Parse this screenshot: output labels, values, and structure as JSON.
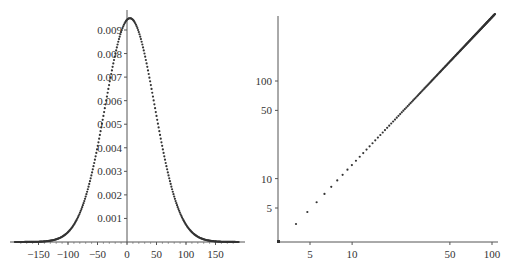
{
  "colors": {
    "axis": "#555555",
    "curve": "#333333",
    "background": "#ffffff"
  },
  "chart_data": [
    {
      "type": "scatter",
      "title": "",
      "xlabel": "",
      "ylabel": "",
      "description": "Gaussian-shaped density curve plotted as dense points",
      "xlim": [
        -190,
        190
      ],
      "ylim": [
        0,
        0.0096
      ],
      "grid": false,
      "x_ticks": [
        -150,
        -100,
        -50,
        0,
        50,
        100,
        150
      ],
      "x_tick_labels": [
        "−150",
        "−100",
        "−50",
        "0",
        "50",
        "100",
        "150"
      ],
      "y_ticks": [
        0.001,
        0.002,
        0.003,
        0.004,
        0.005,
        0.006,
        0.007,
        0.008,
        0.009
      ],
      "y_tick_labels": [
        "0.001",
        "0.002",
        "0.003",
        "0.004",
        "0.005",
        "0.006",
        "0.007",
        "0.008",
        "0.009"
      ],
      "series": [
        {
          "name": "density",
          "model": "normal",
          "mean": 5,
          "sd": 42,
          "peak": 0.0095,
          "x": [
            -190,
            -150,
            -125,
            -100,
            -75,
            -50,
            -25,
            0,
            5,
            25,
            50,
            75,
            100,
            125,
            150,
            190
          ],
          "y": [
            0.0,
            2e-05,
            0.00013,
            0.0006,
            0.0019,
            0.004,
            0.0071,
            0.0093,
            0.0095,
            0.0085,
            0.006,
            0.0031,
            0.0011,
            0.0003,
            5e-05,
            0.0
          ]
        }
      ]
    },
    {
      "type": "scatter",
      "title": "",
      "xlabel": "",
      "ylabel": "",
      "description": "Log-log scatter of points lying on a straight line y = x",
      "scale": "log-log",
      "xlim": [
        2.6,
        100
      ],
      "ylim": [
        2.6,
        300
      ],
      "grid": false,
      "x_ticks": [
        5,
        10,
        50,
        100
      ],
      "x_tick_labels": [
        "5",
        "10",
        "50",
        "100"
      ],
      "y_ticks": [
        5,
        10,
        50,
        100
      ],
      "y_tick_labels": [
        "5",
        "10",
        "50",
        "100"
      ],
      "series": [
        {
          "name": "points",
          "x": [
            4,
            5,
            6,
            7,
            8,
            9,
            10,
            11,
            12,
            13,
            14,
            15,
            20,
            30,
            50,
            75,
            100
          ],
          "y": [
            3.2,
            4.6,
            6.4,
            8.3,
            10.1,
            12.2,
            14.3,
            16.5,
            18.7,
            21,
            23.3,
            25.7,
            38,
            65,
            125,
            210,
            300
          ]
        }
      ]
    }
  ],
  "left_chart": {
    "x_labels": [
      "−150",
      "−100",
      "−50",
      "0",
      "50",
      "100",
      "150"
    ],
    "y_labels": [
      "0.001",
      "0.002",
      "0.003",
      "0.004",
      "0.005",
      "0.006",
      "0.007",
      "0.008",
      "0.009"
    ]
  },
  "right_chart": {
    "x_labels": [
      "5",
      "10",
      "50",
      "100"
    ],
    "y_labels": [
      "5",
      "10",
      "50",
      "100"
    ]
  }
}
